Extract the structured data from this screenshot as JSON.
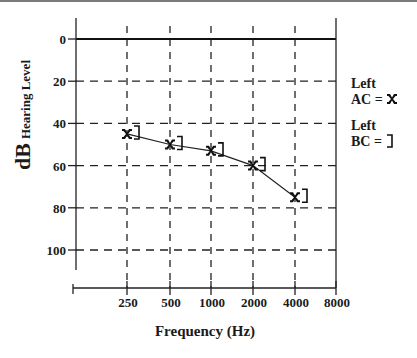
{
  "chart_data": {
    "type": "line",
    "title": "",
    "xlabel": "Frequency (Hz)",
    "ylabel": "dB Hearing Level",
    "ylabel_main": "dB",
    "ylabel_sub": "Hearing Level",
    "categories": [
      "250",
      "500",
      "1000",
      "2000",
      "4000",
      "8000"
    ],
    "y_ticks": [
      "0",
      "20",
      "40",
      "60",
      "80",
      "100"
    ],
    "ylim": [
      0,
      100
    ],
    "y_inverted": true,
    "grid": "dashed",
    "series": [
      {
        "name": "Left AC",
        "marker": "X",
        "values": [
          45,
          50,
          53,
          60,
          75,
          null
        ]
      },
      {
        "name": "Left BC",
        "marker": "]",
        "values": [
          45,
          50,
          53,
          60,
          75,
          null
        ]
      }
    ],
    "legend": {
      "position": "right",
      "entries": [
        {
          "line1": "Left",
          "line2": "AC =",
          "symbol": "X"
        },
        {
          "line1": "Left",
          "line2": "BC =",
          "symbol": "]"
        }
      ]
    }
  }
}
